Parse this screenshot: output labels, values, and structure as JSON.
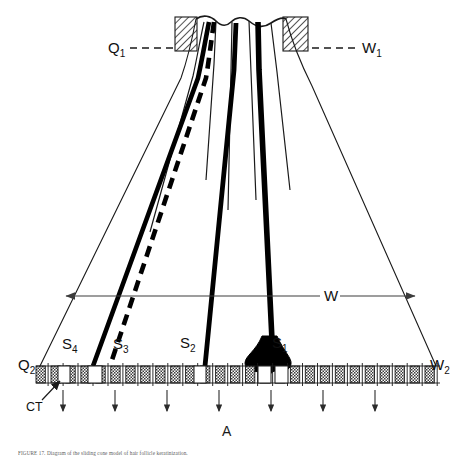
{
  "figure": {
    "panel_label": "A",
    "caption": "FIGURE 17.  Diagram of the sliding cone model of hair follicle keratinization.",
    "labels": {
      "q1": {
        "base": "Q",
        "sub": "1"
      },
      "w1": {
        "base": "W",
        "sub": "1"
      },
      "q2": {
        "base": "Q",
        "sub": "2"
      },
      "w2": {
        "base": "W",
        "sub": "2"
      },
      "w": {
        "base": "W",
        "sub": ""
      },
      "s1": {
        "base": "S",
        "sub": "1"
      },
      "s2": {
        "base": "S",
        "sub": "2"
      },
      "s3": {
        "base": "S",
        "sub": "3"
      },
      "s4": {
        "base": "S",
        "sub": "4"
      },
      "ct": {
        "base": "CT",
        "sub": ""
      }
    },
    "colors": {
      "ink": "#000000",
      "outline": "#1a1a1a",
      "hatch": "#2b2b2b",
      "cell_fill": "#9a9a9a",
      "background": "#ffffff",
      "leader": "#4a4a4a"
    },
    "geometry": {
      "cell_row_y": 366,
      "cell_row_left": 36,
      "cell_row_right": 440,
      "cell_count": 27,
      "arrow_count": 7,
      "dimension_w_y": 296
    }
  }
}
